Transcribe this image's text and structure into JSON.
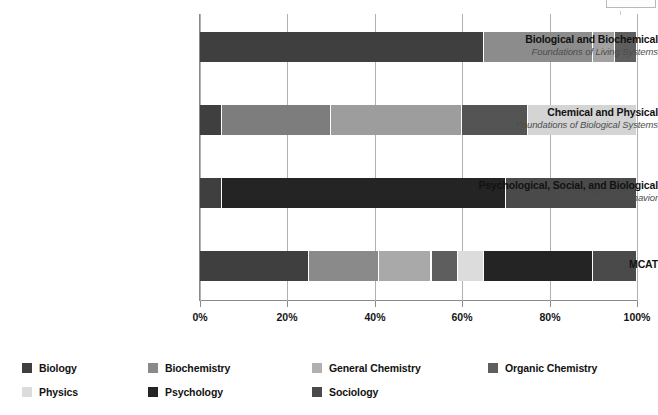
{
  "chart_data": {
    "type": "bar",
    "subtype": "stacked-horizontal-100-percent",
    "title": "",
    "xlabel": "",
    "ylabel": "",
    "xlim": [
      0,
      100
    ],
    "xticks": [
      "0%",
      "20%",
      "40%",
      "60%",
      "80%",
      "100%"
    ],
    "xtick_values": [
      0,
      20,
      40,
      60,
      80,
      100
    ],
    "grid": true,
    "legend_position": "bottom",
    "categories": [
      "Biological and Biochemical Foundations of Living Systems",
      "Chemical and Physical Foundations of Biological Systems",
      "Psychological, Social, and Biological Foundations of Behavior",
      "MCAT"
    ],
    "series": [
      {
        "name": "Biology",
        "color": "#3f3f3f",
        "values": [
          65,
          5,
          5,
          25
        ]
      },
      {
        "name": "Biochemistry",
        "color": "#8c8c8c",
        "values": [
          25,
          25,
          0,
          16
        ]
      },
      {
        "name": "General Chemistry",
        "color": "#a9a9a9",
        "values": [
          0,
          30,
          0,
          12
        ]
      },
      {
        "name": "Organic Chemistry",
        "color": "#5e5e5e",
        "values": [
          5,
          15,
          0,
          6
        ]
      },
      {
        "name": "Physics",
        "color": "#d8d8d8",
        "values": [
          5,
          25,
          0,
          6
        ]
      },
      {
        "name": "Psychology",
        "color": "#242424",
        "values": [
          0,
          0,
          65,
          25
        ]
      },
      {
        "name": "Sociology",
        "color": "#4a4a4a",
        "values": [
          0,
          0,
          30,
          10
        ]
      }
    ]
  },
  "rows": [
    {
      "title": "Biological and Biochemical",
      "subtitle": "Foundations of Living Systems",
      "segments": [
        {
          "label": "Biology",
          "start": 0,
          "end": 65,
          "color": "#3f3f3f"
        },
        {
          "label": "Biochemistry",
          "start": 65,
          "end": 90,
          "color": "#8c8c8c"
        },
        {
          "label": "Physics",
          "start": 90,
          "end": 95,
          "color": "#a2a2a2"
        },
        {
          "label": "Organic Chemistry",
          "start": 95,
          "end": 100,
          "color": "#5e5e5e"
        }
      ]
    },
    {
      "title": "Chemical and Physical",
      "subtitle": "Foundations of Biological Systems",
      "segments": [
        {
          "label": "Biology",
          "start": 0,
          "end": 5,
          "color": "#3f3f3f"
        },
        {
          "label": "Biochemistry",
          "start": 5,
          "end": 30,
          "color": "#7d7d7d"
        },
        {
          "label": "General Chemistry",
          "start": 30,
          "end": 60,
          "color": "#9d9d9d"
        },
        {
          "label": "Organic Chemistry",
          "start": 60,
          "end": 75,
          "color": "#545454"
        },
        {
          "label": "Physics",
          "start": 75,
          "end": 100,
          "color": "#d4d4d4"
        }
      ]
    },
    {
      "title": "Psychological, Social, and Biological",
      "subtitle": "Foundations of Behavior",
      "segments": [
        {
          "label": "Biology",
          "start": 0,
          "end": 5,
          "color": "#3f3f3f"
        },
        {
          "label": "Psychology",
          "start": 5,
          "end": 70,
          "color": "#242424"
        },
        {
          "label": "Sociology",
          "start": 70,
          "end": 100,
          "color": "#4a4a4a"
        }
      ]
    },
    {
      "title": "MCAT",
      "subtitle": "",
      "segments": [
        {
          "label": "Biology",
          "start": 0,
          "end": 25,
          "color": "#3f3f3f"
        },
        {
          "label": "Biochemistry",
          "start": 25,
          "end": 41,
          "color": "#8a8a8a"
        },
        {
          "label": "General Chemistry",
          "start": 41,
          "end": 53,
          "color": "#a9a9a9"
        },
        {
          "label": "Organic Chemistry",
          "start": 53,
          "end": 59,
          "color": "#5e5e5e"
        },
        {
          "label": "Physics",
          "start": 59,
          "end": 65,
          "color": "#dcdcdc"
        },
        {
          "label": "Psychology",
          "start": 65,
          "end": 90,
          "color": "#242424"
        },
        {
          "label": "Sociology",
          "start": 90,
          "end": 100,
          "color": "#4a4a4a"
        }
      ]
    }
  ],
  "axis": {
    "ticks": [
      {
        "label": "0%",
        "value": 0
      },
      {
        "label": "20%",
        "value": 20
      },
      {
        "label": "40%",
        "value": 40
      },
      {
        "label": "60%",
        "value": 60
      },
      {
        "label": "80%",
        "value": 80
      },
      {
        "label": "100%",
        "value": 100
      }
    ]
  },
  "legend": {
    "items": [
      {
        "label": "Biology",
        "color": "#3f3f3f"
      },
      {
        "label": "Biochemistry",
        "color": "#8a8a8a"
      },
      {
        "label": "General Chemistry",
        "color": "#b0b0b0"
      },
      {
        "label": "Organic Chemistry",
        "color": "#5e5e5e"
      },
      {
        "label": "Physics",
        "color": "#dcdcdc"
      },
      {
        "label": "Psychology",
        "color": "#242424"
      },
      {
        "label": "Sociology",
        "color": "#4a4a4a"
      }
    ]
  }
}
